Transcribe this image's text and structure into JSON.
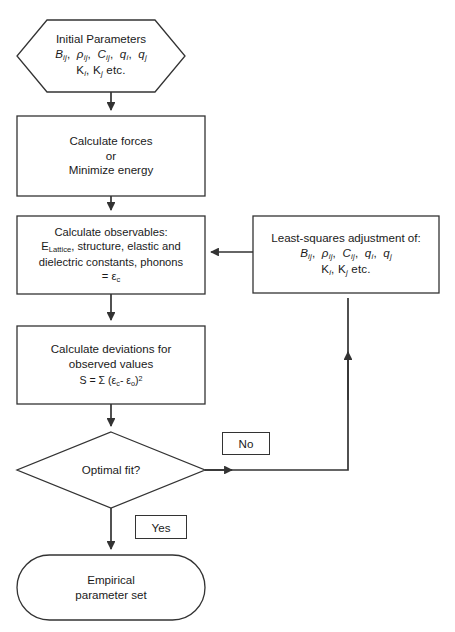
{
  "diagram": {
    "type": "flowchart",
    "background_color": "#ffffff",
    "line_color": "#333333",
    "text_color": "#1a1a1a"
  },
  "nodes": {
    "initial_parameters": {
      "shape": "hexagon",
      "line1": "Initial Parameters",
      "line2_parts": [
        {
          "sym": "B",
          "sub": "ij"
        },
        {
          "sym": "ρ",
          "sub": "ij"
        },
        {
          "sym": "C",
          "sub": "ij"
        },
        {
          "sym": "q",
          "sub": "i"
        },
        {
          "sym": "q",
          "sub": "j"
        }
      ],
      "line3_parts": [
        {
          "sym": "K",
          "sub": "i"
        },
        {
          "sym": "K",
          "sub": "j"
        }
      ],
      "line3_tail": "etc."
    },
    "calculate_forces": {
      "shape": "rectangle",
      "line1": "Calculate forces",
      "line2": "or",
      "line3": "Minimize energy"
    },
    "calculate_observables": {
      "shape": "rectangle",
      "line1": "Calculate observables:",
      "line2_prefix": "E",
      "line2_sub": "Lattice",
      "line2_rest": ", structure, elastic and",
      "line3": "dielectric constants, phonons",
      "line4_prefix": "= ",
      "line4_sym": "ε",
      "line4_sub": "c"
    },
    "least_squares": {
      "shape": "rectangle",
      "line1": "Least-squares adjustment of:",
      "line2_parts": [
        {
          "sym": "B",
          "sub": "ij"
        },
        {
          "sym": "ρ",
          "sub": "ij"
        },
        {
          "sym": "C",
          "sub": "ij"
        },
        {
          "sym": "q",
          "sub": "i"
        },
        {
          "sym": "q",
          "sub": "j"
        }
      ],
      "line3_parts": [
        {
          "sym": "K",
          "sub": "i"
        },
        {
          "sym": "K",
          "sub": "j"
        }
      ],
      "line3_tail": "etc."
    },
    "calculate_deviations": {
      "shape": "rectangle",
      "line1": "Calculate deviations for",
      "line2": "observed values",
      "formula_lhs": "S",
      "formula_eq": "=",
      "formula_sigma": "Σ",
      "formula_open": "(",
      "formula_eps1": "ε",
      "formula_eps1_sub": "c",
      "formula_minus": "-",
      "formula_eps2": "ε",
      "formula_eps2_sub": "o",
      "formula_close": ")",
      "formula_exp": "2"
    },
    "optimal_fit": {
      "shape": "diamond",
      "label": "Optimal fit?"
    },
    "empirical_parameter_set": {
      "shape": "stadium",
      "line1": "Empirical",
      "line2": "parameter set"
    }
  },
  "edge_labels": {
    "no": "No",
    "yes": "Yes"
  }
}
